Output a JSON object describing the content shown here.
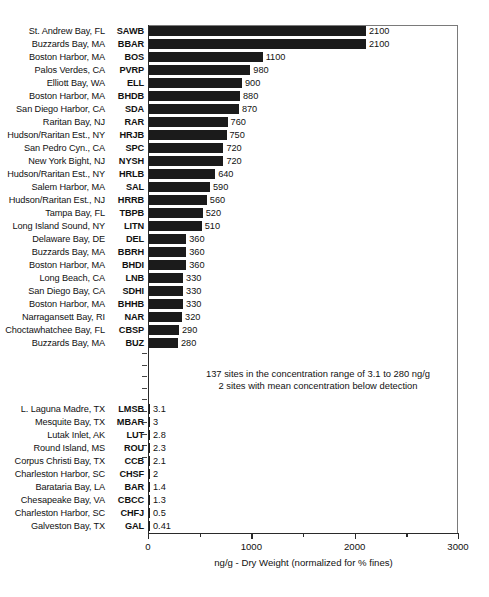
{
  "chart_data": {
    "type": "bar",
    "orientation": "horizontal",
    "title": "",
    "xlabel": "ng/g - Dry Weight (normalized for % fines)",
    "ylabel": "",
    "xlim": [
      0,
      3000
    ],
    "xticks": [
      0,
      1000,
      2000,
      3000
    ],
    "xtick_labels": [
      "0",
      "1000",
      "2000",
      "3000"
    ],
    "minor_ticks": [
      500,
      1500,
      2500
    ],
    "grid": false,
    "legend": null,
    "annotations": [
      "137 sites in the concentration range of 3.1 to 280 ng/g",
      "2 sites with mean concentration below detection"
    ],
    "break_marker": {
      "present": true,
      "dash_count": 10,
      "meaning": "omitted intermediate sites"
    },
    "top_group": {
      "categories": [
        "St. Andrew Bay, FL",
        "Buzzards Bay, MA",
        "Boston Harbor, MA",
        "Palos Verdes, CA",
        "Elliott Bay, WA",
        "Boston Harbor, MA",
        "San Diego Harbor, CA",
        "Raritan Bay, NJ",
        "Hudson/Raritan Est., NY",
        "San Pedro Cyn., CA",
        "New York Bight, NJ",
        "Hudson/Raritan Est., NY",
        "Salem Harbor, MA",
        "Hudson/Raritan Est., NJ",
        "Tampa Bay, FL",
        "Long Island Sound, NY",
        "Delaware Bay, DE",
        "Buzzards Bay, MA",
        "Boston Harbor, MA",
        "Long Beach, CA",
        "San Diego Bay, CA",
        "Boston Harbor, MA",
        "Narragansett Bay, RI",
        "Choctawhatchee Bay, FL",
        "Buzzards Bay, MA"
      ],
      "codes": [
        "SAWB",
        "BBAR",
        "BOS",
        "PVRP",
        "ELL",
        "BHDB",
        "SDA",
        "RAR",
        "HRJB",
        "SPC",
        "NYSH",
        "HRLB",
        "SAL",
        "HRRB",
        "TBPB",
        "LITN",
        "DEL",
        "BBRH",
        "BHDI",
        "LNB",
        "SDHI",
        "BHHB",
        "NAR",
        "CBSP",
        "BUZ"
      ],
      "values": [
        2100,
        2100,
        1100,
        980,
        900,
        880,
        870,
        760,
        750,
        720,
        720,
        640,
        590,
        560,
        520,
        510,
        360,
        360,
        360,
        330,
        330,
        330,
        320,
        290,
        280
      ],
      "value_labels": [
        "2100",
        "2100",
        "1100",
        "980",
        "900",
        "880",
        "870",
        "760",
        "750",
        "720",
        "720",
        "640",
        "590",
        "560",
        "520",
        "510",
        "360",
        "360",
        "360",
        "330",
        "330",
        "330",
        "320",
        "290",
        "280"
      ]
    },
    "bottom_group": {
      "categories": [
        "L. Laguna Madre, TX",
        "Mesquite Bay, TX",
        "Lutak Inlet, AK",
        "Round Island, MS",
        "Corpus Christi Bay, TX",
        "Charleston Harbor, SC",
        "Barataria Bay, LA",
        "Chesapeake Bay, VA",
        "Charleston Harbor, SC",
        "Galveston Bay, TX"
      ],
      "codes": [
        "LMSB",
        "MBAR",
        "LUT",
        "ROU",
        "CCB",
        "CHSF",
        "BAR",
        "CBCC",
        "CHFJ",
        "GAL"
      ],
      "values": [
        3.1,
        3,
        2.8,
        2.3,
        2.1,
        2,
        1.4,
        1.3,
        0.5,
        0.41
      ],
      "value_labels": [
        "3.1",
        "3",
        "2.8",
        "2.3",
        "2.1",
        "2",
        "1.4",
        "1.3",
        "0.5",
        "0.41"
      ]
    },
    "colors": {
      "bar": "#1b1b1b",
      "axis": "#2a2a2a",
      "frame": "#7a7a7a",
      "text": "#111111",
      "background": "#ffffff"
    }
  }
}
